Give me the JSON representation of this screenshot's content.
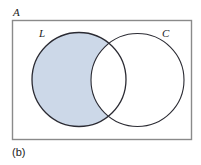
{
  "figure": {
    "caption": "(b)",
    "universe_label": "A",
    "sets": [
      {
        "key": "L",
        "label": "L",
        "shaded": true
      },
      {
        "key": "C",
        "label": "C",
        "shaded": false
      }
    ],
    "shaded_description": "L minus C",
    "colors": {
      "shade_fill": "#ccd8e8",
      "circle_stroke": "#2b2b33",
      "rect_stroke": "#8a8a8a",
      "background": "#ffffff",
      "text": "#1b1b1b"
    },
    "geometry": {
      "rect": {
        "x": 12,
        "y": 20,
        "width": 180,
        "height": 120
      },
      "circle_l": {
        "cx": 79,
        "cy": 79.5,
        "r": 47
      },
      "circle_c": {
        "cx": 137.5,
        "cy": 80,
        "r": 46.5
      }
    }
  }
}
